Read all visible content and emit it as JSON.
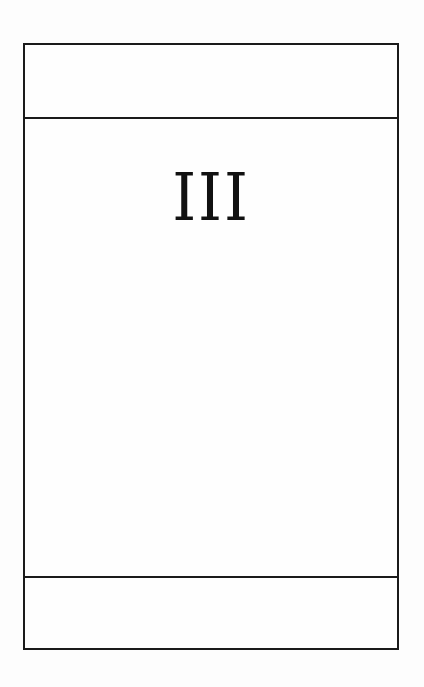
{
  "card": {
    "numeral": "III",
    "top_band_text": "",
    "bottom_band_text": ""
  },
  "colors": {
    "border": "#1a1a1a",
    "background": "#fdfdfd",
    "text": "#111111"
  }
}
